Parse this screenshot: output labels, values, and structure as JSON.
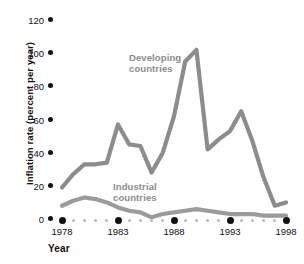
{
  "chart_data": {
    "type": "line",
    "title": "",
    "xlabel": "Year",
    "ylabel": "Inflation rate (percent per year)",
    "xlim": [
      1978,
      1998
    ],
    "ylim": [
      0,
      120
    ],
    "ytick_labels": [
      "0",
      "20",
      "40",
      "60",
      "80",
      "100",
      "120"
    ],
    "yticks": [
      0,
      20,
      40,
      60,
      80,
      100,
      120
    ],
    "xtick_labels": [
      "1978",
      "1983",
      "1988",
      "1993",
      "1998"
    ],
    "xticks": [
      1978,
      1983,
      1988,
      1993,
      1998
    ],
    "grid": false,
    "legend_position": "inline-annotations",
    "x": [
      1978,
      1979,
      1980,
      1981,
      1982,
      1983,
      1984,
      1985,
      1986,
      1987,
      1988,
      1989,
      1990,
      1991,
      1992,
      1993,
      1994,
      1995,
      1996,
      1997,
      1998
    ],
    "series": [
      {
        "name": "Developing countries",
        "color": "#8c8c8c",
        "values": [
          19,
          27,
          33,
          33,
          34,
          57,
          45,
          44,
          28,
          40,
          62,
          95,
          102,
          42,
          48,
          53,
          65,
          47,
          25,
          8,
          10
        ]
      },
      {
        "name": "Industrial countries",
        "color": "#9b9b9b",
        "values": [
          8,
          11,
          13,
          12,
          10,
          7,
          5,
          4,
          1,
          3,
          4,
          5,
          6,
          5,
          4,
          3,
          3,
          3,
          2,
          2,
          2
        ]
      }
    ],
    "annotations": [
      {
        "text_line1": "Developing",
        "text_line2": "countries"
      },
      {
        "text_line1": "Industrial",
        "text_line2": "countries"
      }
    ]
  },
  "axis": {
    "y_title": "Inflation rate (percent per year)",
    "x_title": "Year",
    "y_tick_0": "0",
    "y_tick_20": "20",
    "y_tick_40": "40",
    "y_tick_60": "60",
    "y_tick_80": "80",
    "y_tick_100": "100",
    "y_tick_120": "120",
    "x_tick_1978": "1978",
    "x_tick_1983": "1983",
    "x_tick_1988": "1988",
    "x_tick_1993": "1993",
    "x_tick_1998": "1998"
  },
  "labels": {
    "developing_line1": "Developing",
    "developing_line2": "countries",
    "industrial_line1": "Industrial",
    "industrial_line2": "countries"
  },
  "colors": {
    "developing_series": "#8c8c8c",
    "industrial_series": "#9b9b9b",
    "axis_text": "#111111",
    "minor_tick": "#b8b8b8",
    "background": "#ffffff"
  }
}
